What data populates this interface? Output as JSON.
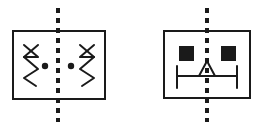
{
  "page": {
    "title": "Symmetry Symbols Diagram",
    "background_color": "#ffffff",
    "width": 267,
    "height": 130
  },
  "style": {
    "stroke_color": "#1a1a1a",
    "fill_color": "#1a1a1a",
    "shape_background": "#ffffff",
    "rect_stroke_width": 2,
    "detail_stroke_width": 2,
    "centerline_stroke_width": 4,
    "centerline_dash_pattern": "5 5"
  },
  "figures": [
    {
      "id": "left-symbol",
      "name": "mirrored-spring-pair-symbol",
      "label": "Mirrored spring pair with centerline",
      "rect": {
        "x": 13,
        "y": 31,
        "width": 92,
        "height": 68
      },
      "centerline": {
        "x": 58,
        "y_top": 8,
        "y_bottom": 122
      },
      "elements": [
        {
          "name": "left-spring-zigzag",
          "type": "polyline",
          "points": "24,45 38,57 24,57 38,69 24,78 36,86"
        },
        {
          "name": "left-spring-cross-stroke",
          "type": "line",
          "points": "24,57 38,45"
        },
        {
          "name": "left-dot",
          "type": "dot",
          "cx": 45,
          "cy": 66,
          "r": 3.2
        },
        {
          "name": "right-spring-zigzag",
          "type": "polyline",
          "points": "94,45 80,57 94,57 80,69 94,78 82,86"
        },
        {
          "name": "right-spring-cross-stroke",
          "type": "line",
          "points": "94,57 80,45"
        },
        {
          "name": "right-dot",
          "type": "dot",
          "cx": 71,
          "cy": 66,
          "r": 3.2
        }
      ]
    },
    {
      "id": "right-symbol",
      "name": "valve-block-symbol",
      "label": "Valve block with filled squares and triangle",
      "rect": {
        "x": 164,
        "y": 31,
        "width": 86,
        "height": 67
      },
      "centerline": {
        "x": 207,
        "y_top": 8,
        "y_bottom": 122
      },
      "elements": [
        {
          "name": "left-filled-square",
          "type": "square",
          "x": 179,
          "y": 46,
          "size": 15
        },
        {
          "name": "right-filled-square",
          "type": "square",
          "x": 221,
          "y": 46,
          "size": 15
        },
        {
          "name": "hollow-triangle",
          "type": "triangle",
          "points": "207,61 215,76 199,76"
        },
        {
          "name": "horizontal-bar",
          "type": "line",
          "points": "177,76 237,76"
        },
        {
          "name": "left-end-cap",
          "type": "line",
          "points": "177,66 177,88"
        },
        {
          "name": "right-end-cap",
          "type": "line",
          "points": "237,66 237,88"
        }
      ]
    }
  ]
}
